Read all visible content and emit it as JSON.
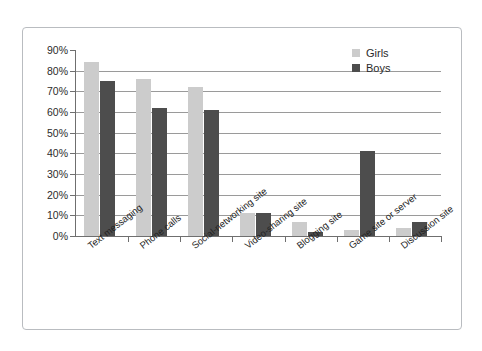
{
  "chart_data": {
    "type": "bar",
    "title": "",
    "xlabel": "",
    "ylabel": "",
    "ylim": [
      0,
      90
    ],
    "ytick_labels": [
      "90%",
      "80%",
      "70%",
      "60%",
      "50%",
      "40%",
      "30%",
      "20%",
      "10%",
      "0%"
    ],
    "ytick_values": [
      90,
      80,
      70,
      60,
      50,
      40,
      30,
      20,
      10,
      0
    ],
    "grid": true,
    "legend_position": "top-right",
    "categories": [
      "Text messaging",
      "Phone calls",
      "Social-networking site",
      "Video-sharing site",
      "Blogging site",
      "Game site or server",
      "Discussion site"
    ],
    "series": [
      {
        "name": "Girls",
        "color": "#cccccc",
        "values": [
          84,
          76,
          72,
          11,
          7,
          3,
          4
        ]
      },
      {
        "name": "Boys",
        "color": "#4d4d4d",
        "values": [
          75,
          62,
          61,
          11,
          2,
          41,
          7
        ]
      }
    ]
  },
  "legend": {
    "items": [
      {
        "label": "Girls",
        "color": "#cccccc"
      },
      {
        "label": "Boys",
        "color": "#4d4d4d"
      }
    ]
  },
  "colors": {
    "girls": "#cccccc",
    "boys": "#4d4d4d",
    "gridline": "#9a9a9a",
    "axis": "#6f6f6f",
    "frame": "#b9bcc0",
    "text": "#2b2b2b",
    "background": "#ffffff"
  }
}
